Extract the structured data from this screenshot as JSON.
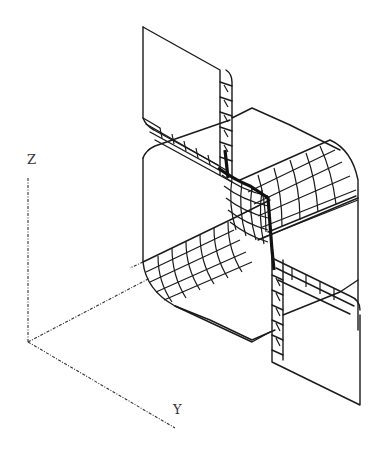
{
  "figure": {
    "axes": {
      "z_label": "Z",
      "y_label": "Y"
    },
    "colors": {
      "line": "#1a1a1a",
      "background": "#ffffff"
    }
  }
}
